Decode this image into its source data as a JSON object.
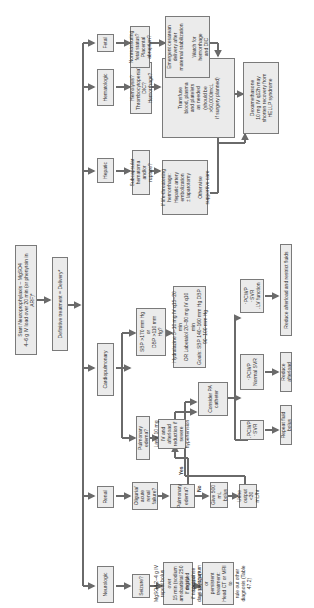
{
  "flowchart": {
    "start": "Start Neuroprophylaxis – MgSO4\n4–6 g IV load over 20 min (or phenytoin in ARF)*",
    "definitive": "Definitive treatment = Delivery*",
    "categories": {
      "neurologic": "Neurologic",
      "renal": "Renal",
      "cardiopulmonary": "Cardiopulmonary",
      "hepatic": "Hepatic",
      "hematologic": "Hematologic",
      "fetal": "Fetal"
    },
    "neurologic": {
      "seizure": "Seizure?",
      "mgso4": "MgSO4 2–4 g IV\nrepeat bolus over\n15 min (sodium\namobarbital 250 mg IV\nif no response\nto MgSO4)*",
      "delayed": "If delayed several\ndays postpartum or\npersistent treatment:\nHead CT or MRI to\nrule out other\ndiagnosis (Table 47.2)"
    },
    "renal": {
      "oliguria": "Oliguria/\nacute renal\nfailure?",
      "pulm_edema_q": "Pulmonary\nedema?",
      "yes_label": "Yes",
      "no_label": "No",
      "give_bolus": "Give 500 mL\nbolus",
      "urine_output": "Urine output\n<30 mL/hr"
    },
    "cardiopulmonary": {
      "pulm_edema": "Pulmonary edema?",
      "lasix": "Lasix 10 mg\nIV and afterload\nreduction if severe\nhypertension",
      "sbp_q": "SBP >170 mm Hg\nor\nDBP >110 mm Hg?",
      "meds": "Hydralazine 5–10 mg IV q15–20 min\nOR Labetalol 20–80 mg IV q10 min\nGoals: SBP 140–160 mm Hg DBP 90–100 mm Hg",
      "pa_catheter": "Consider PA\ncatheter",
      "pcwp_low": "↓PCWP\n↑SVR",
      "pcwp_normal": "↑PCWP\nNormal SVR",
      "pcwp_high": "↑PCWP\n↑SVR\n↓LV function",
      "repeat_fluid": "Repeat fluid bolus",
      "reduce_afterload": "Reduce afterload",
      "reduce_afterload_fluids": "Reduce afterload and restrict fluids"
    },
    "hepatic": {
      "hematoma": "Subcapsular\nhematoma and/or\nrupture?",
      "supportive": "If life-threatening\nhemorrhage:\nHepatic artery\nembolization\n± laparotomy\n\nOtherwise\nsupportive care"
    },
    "hematologic": {
      "question": "Hemolysis?\nThrombocytopenia?\nDIC?\nHemorrhage?",
      "transfuse": "Transfuse\nblood, plasma\nand platelets\nas needed\n(should be\n>50,000/mcL\nif surgery planned)"
    },
    "fetal": {
      "question": "Nonreassuring\nfetal status?\nPlacental\nabruption?",
      "cesarean": "Emergent cesarean\ndelivery after\nmaternal stabilization\n\nWatch for\nhemorrhage\nand DIC"
    },
    "dexamethasone": "Dexamethasone\n10 mg IV q12h may\nshorten recovery from\nHELLP syndrome"
  }
}
